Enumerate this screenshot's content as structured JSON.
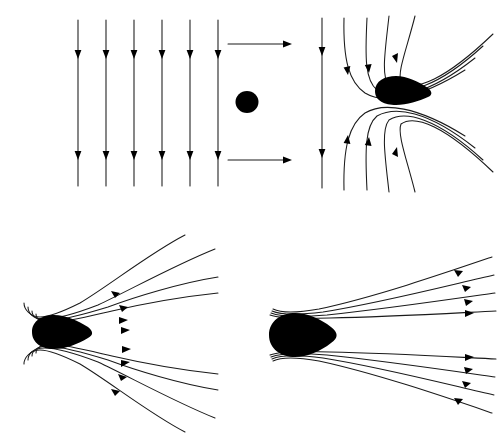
{
  "figure": {
    "type": "streamline-diagram",
    "background_color": "#ffffff",
    "line_color": "#1a1a1a",
    "obstacle_color": "#000000",
    "panel_count": 4
  },
  "panels": [
    {
      "id": "top-left",
      "name": "uniform-field-with-circular-obstacle",
      "description": "Six straight vertical field lines with downward arrowheads, two horizontal arrows pointing right, and a small filled circular obstacle",
      "field_line_count": 6,
      "field_line_orientation": "vertical",
      "arrow_direction": "down",
      "horizontal_arrow_count": 2,
      "horizontal_arrow_direction": "right",
      "obstacle_shape": "circle",
      "obstacle_center": [
        247,
        102
      ],
      "obstacle_radius": 11,
      "line_x_positions": [
        78,
        106,
        134,
        162,
        190,
        218
      ],
      "line_y_start": 20,
      "line_y_end": 186,
      "arrow_y_positions": [
        55,
        155
      ],
      "horizontal_arrows": [
        {
          "x_start": 228,
          "x_end": 290,
          "y": 44
        },
        {
          "x_start": 228,
          "x_end": 290,
          "y": 160
        }
      ]
    },
    {
      "id": "top-right",
      "name": "early-deformation-streamlines",
      "description": "One straight vertical line at left and eight streamlines bending around a teardrop obstacle whose blunt end faces left",
      "field_line_count": 9,
      "streamline_count": 8,
      "arrow_direction": "outward",
      "obstacle_shape": "teardrop",
      "obstacle_tip_direction": "right",
      "has_straight_reference_line": true
    },
    {
      "id": "bottom-left",
      "name": "wrapped-streamlines",
      "description": "Eight streamlines wrapping tightly around the blunt nose of a teardrop obstacle and fanning out to the right",
      "streamline_count": 8,
      "arrow_direction": "right",
      "obstacle_shape": "teardrop",
      "obstacle_tip_direction": "right",
      "fan_spread": "wide"
    },
    {
      "id": "bottom-right",
      "name": "collapsed-streamlines",
      "description": "Eight nearly straight streamlines radiating from the tip of a rounded obstacle with minimal curvature",
      "streamline_count": 8,
      "arrow_direction": "right",
      "obstacle_shape": "rounded-teardrop",
      "obstacle_tip_direction": "right",
      "fan_spread": "narrow"
    }
  ]
}
